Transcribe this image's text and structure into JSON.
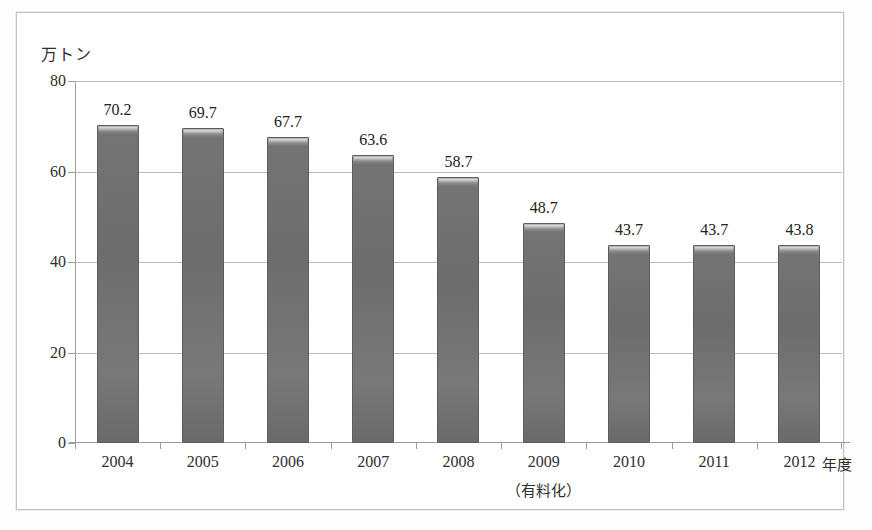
{
  "chart_data": {
    "type": "bar",
    "title": "",
    "subtitle": "",
    "unit_label": "万トン",
    "xlabel": "年度",
    "ylabel": "",
    "ylim": [
      0,
      80
    ],
    "yticks": [
      0,
      20,
      40,
      60,
      80
    ],
    "ytick_labels": [
      "0",
      "20",
      "40",
      "60",
      "80"
    ],
    "grid": true,
    "legend": null,
    "categories": [
      "2004",
      "2005",
      "2006",
      "2007",
      "2008",
      "2009",
      "2010",
      "2011",
      "2012"
    ],
    "category_annotations": [
      "",
      "",
      "",
      "",
      "",
      "（有料化）",
      "",
      "",
      ""
    ],
    "values": [
      70.2,
      69.7,
      67.7,
      63.6,
      58.7,
      48.7,
      43.7,
      43.7,
      43.8
    ],
    "value_labels": [
      "70.2",
      "69.7",
      "67.7",
      "63.6",
      "58.7",
      "48.7",
      "43.7",
      "43.7",
      "43.8"
    ],
    "bar_color": "#6d6d6d",
    "bar_edge_color": "#5d5d5d",
    "grid_color": "#b9bcbf",
    "axis_color": "#9a9d9f",
    "frame_color": "#bfc2c5",
    "background": "#ffffff"
  }
}
